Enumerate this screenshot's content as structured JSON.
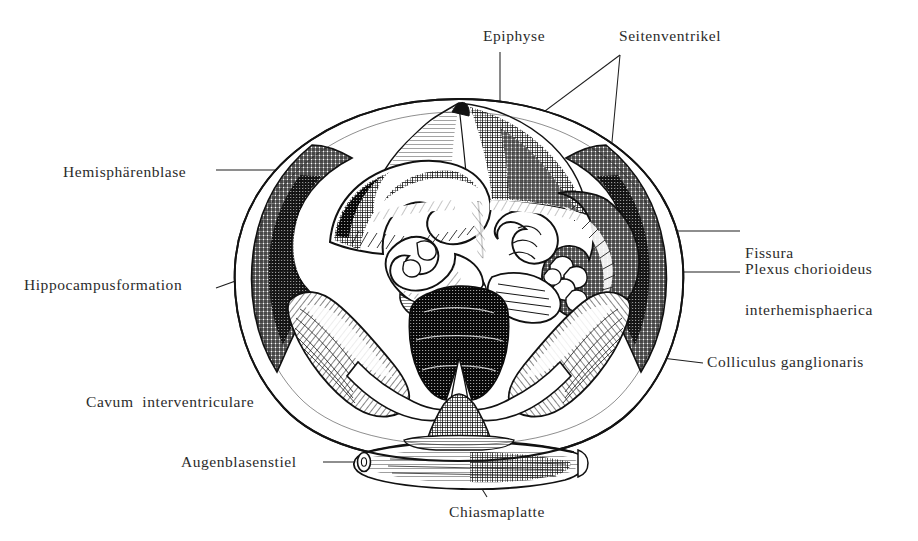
{
  "figure": {
    "medium": "engraving",
    "background_color": "#ffffff",
    "ink_color": "#1a1a1a",
    "label_color": "#2b2b2b",
    "leader_color": "#1f1f1f"
  },
  "labels": {
    "epiphyse": "Epiphyse",
    "seitenventrikel": "Seitenventrikel",
    "hemisphaerenblase": "Hemisphärenblase",
    "fissura_line1": "Fissura",
    "fissura_line2": "interhemisphaerica",
    "hippocampusformation": "Hippocampusformation",
    "plexus_chorioideus": "Plexus chorioideus",
    "colliculus_ganglionaris": "Colliculus ganglionaris",
    "cavum_interventriculare": "Cavum  interventriculare",
    "augenblasenstiel": "Augenblasenstiel",
    "chiasmaplatte": "Chiasmaplatte"
  },
  "structures": [
    {
      "name": "epiphyse",
      "label": "Epiphyse",
      "region": "dorsal-midline-apex"
    },
    {
      "name": "seitenventrikel",
      "label": "Seitenventrikel",
      "region": "lateral-ventricle-cavity"
    },
    {
      "name": "hemisphaerenblase",
      "label": "Hemisphärenblase",
      "region": "hemisphere-vesicle-outer-wall"
    },
    {
      "name": "fissura-interhemisphaerica",
      "label": "Fissura interhemisphaerica",
      "region": "median-cleft"
    },
    {
      "name": "hippocampusformation",
      "label": "Hippocampusformation",
      "region": "left-medial-wall"
    },
    {
      "name": "plexus-chorioideus",
      "label": "Plexus chorioideus",
      "region": "right-ventricle-roof"
    },
    {
      "name": "colliculus-ganglionaris",
      "label": "Colliculus ganglionaris",
      "region": "right-ventral-eminence"
    },
    {
      "name": "cavum-interventriculare",
      "label": "Cavum interventriculare",
      "region": "left-ventral-cavity"
    },
    {
      "name": "augenblasenstiel",
      "label": "Augenblasenstiel",
      "region": "optic-stalk-left"
    },
    {
      "name": "chiasmaplatte",
      "label": "Chiasmaplatte",
      "region": "ventral-chiasma-band"
    }
  ]
}
